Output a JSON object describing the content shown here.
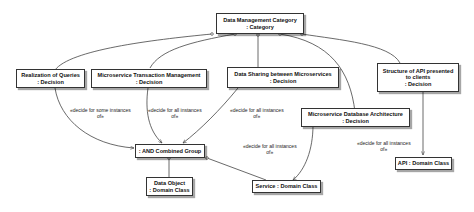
{
  "diagram": {
    "nodes": {
      "category": {
        "line1": "Data Management Category",
        "line2": ": Category"
      },
      "realization": {
        "line1": "Realization of Queries",
        "line2": ": Decision"
      },
      "transaction": {
        "line1": "Microservice Transaction Management",
        "line2": ": Decision"
      },
      "sharing": {
        "line1": "Data Sharing between Microservices",
        "line2": ": Decision"
      },
      "database": {
        "line1": "Microservice Database Architecture",
        "line2": ": Decision"
      },
      "api_structure": {
        "line1": "Structure of API presented",
        "line2": "to clients",
        "line3": ": Decision"
      },
      "and_group": {
        "line1": ": AND Combined Group"
      },
      "data_object": {
        "line1": "Data Object",
        "line2": ": Domain Class"
      },
      "service": {
        "line1": "Service : Domain Class"
      },
      "api": {
        "line1": "API : Domain Class"
      }
    },
    "edge_labels": {
      "realization_to_group": {
        "line1": "«decide for some instances",
        "line2": "of»"
      },
      "transaction_to_group": {
        "line1": "«decide for all instances",
        "line2": "of»"
      },
      "sharing_to_group": {
        "line1": "«decide for all instances",
        "line2": "of»"
      },
      "database_to_service": {
        "line1": "«decide for all instances",
        "line2": "of»"
      },
      "api_structure_to_api": {
        "line1": "«decide for all instances",
        "line2": "of»"
      }
    },
    "colors": {
      "line": "#444444",
      "border": "#333333",
      "background": "#ffffff"
    }
  }
}
